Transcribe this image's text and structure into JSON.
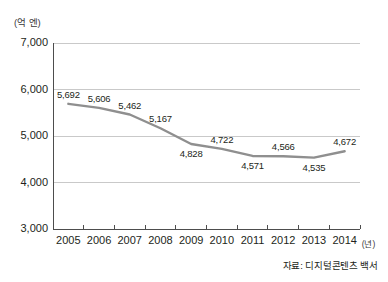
{
  "chart_data": {
    "type": "line",
    "title": "",
    "subtitle": "",
    "xlabel": "(년)",
    "ylabel": "(억 엔)",
    "unit_label": "(억 엔)",
    "x_unit_label": "(년)",
    "categories": [
      "2005",
      "2006",
      "2007",
      "2008",
      "2009",
      "2010",
      "2011",
      "2012",
      "2013",
      "2014"
    ],
    "values": [
      5692,
      5606,
      5462,
      5167,
      4828,
      4722,
      4571,
      4566,
      4535,
      4672
    ],
    "point_labels": [
      "5,692",
      "5,606",
      "5,462",
      "5,167",
      "4,828",
      "4,722",
      "4,571",
      "4,566",
      "4,535",
      "4,672"
    ],
    "label_positions": [
      "above",
      "above",
      "above",
      "above",
      "below",
      "above",
      "below",
      "above",
      "below",
      "above"
    ],
    "ylim": [
      3000,
      7000
    ],
    "y_ticks": [
      3000,
      4000,
      5000,
      6000,
      7000
    ],
    "y_tick_labels": [
      "3,000",
      "4,000",
      "5,000",
      "6,000",
      "7,000"
    ],
    "grid": true,
    "grid_axis": "y",
    "legend": false,
    "legend_position": "none",
    "series_color": "#8f8f8f",
    "axis_color": "#4d4d4d",
    "grid_color": "#c9c9c9",
    "source": "자료: 디지털콘텐츠 백서"
  },
  "source_note": "자료: 디지털콘텐츠 백서"
}
